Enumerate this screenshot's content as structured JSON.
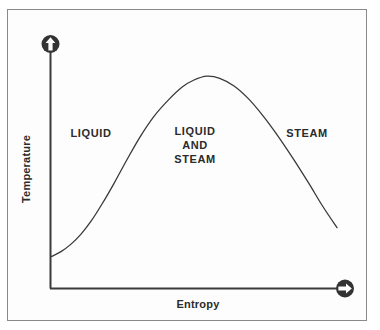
{
  "figure": {
    "background_color": "#fdfdfd",
    "border_color": "#8a8a8a",
    "line_color": "#3a3a3a",
    "text_color": "#2b2b2b",
    "arrow_cap_color": "#333333"
  },
  "axes": {
    "y_title": "Temperature",
    "x_title": "Entropy",
    "y_arrow_icon": "circle-arrow-up-icon",
    "x_arrow_icon": "circle-arrow-right-icon"
  },
  "regions": [
    {
      "id": "liquid",
      "label": "LIQUID"
    },
    {
      "id": "liquid-and-steam",
      "line1": "LIQUID",
      "line2": "AND",
      "line3": "STEAM"
    },
    {
      "id": "steam",
      "label": "STEAM"
    }
  ],
  "chart_data": {
    "type": "line",
    "title": "",
    "subtitle": "",
    "xlabel": "Entropy",
    "ylabel": "Temperature",
    "grid": false,
    "legend": null,
    "axis_ticks": {
      "x": [],
      "y": []
    },
    "xlim": [
      0,
      1
    ],
    "ylim": [
      0,
      1
    ],
    "series": [
      {
        "name": "Vapor dome (saturation curve)",
        "description": "Bell-shaped saturation dome: saturated liquid line rises to the critical point, then the saturated vapor line descends.",
        "x": [
          0.0,
          0.035,
          0.07,
          0.105,
          0.14,
          0.18,
          0.22,
          0.265,
          0.31,
          0.36,
          0.41,
          0.46,
          0.5,
          0.545,
          0.59,
          0.64,
          0.69,
          0.74,
          0.79,
          0.845,
          0.9,
          0.95,
          1.0
        ],
        "y": [
          0.146,
          0.17,
          0.205,
          0.252,
          0.312,
          0.396,
          0.488,
          0.598,
          0.703,
          0.802,
          0.878,
          0.94,
          0.972,
          0.99,
          0.98,
          0.944,
          0.885,
          0.807,
          0.717,
          0.608,
          0.492,
          0.382,
          0.282
        ]
      }
    ],
    "annotations": [
      {
        "text": "LIQUID",
        "x": 0.135,
        "y": 0.545
      },
      {
        "text": "LIQUID AND STEAM",
        "x": 0.485,
        "y": 0.545
      },
      {
        "text": "STEAM",
        "x": 0.865,
        "y": 0.545
      }
    ],
    "critical_point": {
      "x": 0.485,
      "y": 0.995
    }
  }
}
